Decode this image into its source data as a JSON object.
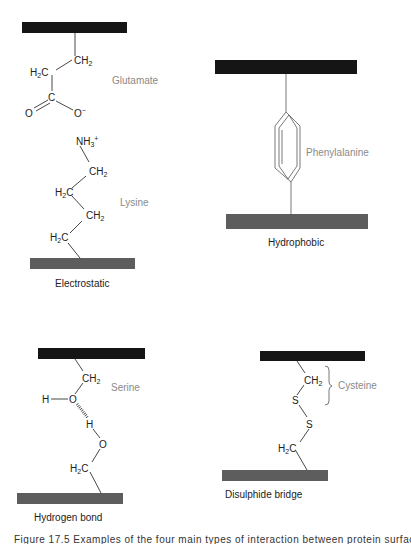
{
  "colors": {
    "surface_top": "#151515",
    "surface_bottom": "#5d5d5d",
    "residue_label": "#8a8a8a",
    "text": "#222222"
  },
  "panels": {
    "electrostatic": {
      "caption": "Electrostatic",
      "top_residue": {
        "name": "Glutamate",
        "atoms": {
          "ch2": "CH",
          "h2c_h": "H",
          "h2c_c": "C",
          "c": "C",
          "o_double": "O",
          "o_minus": "O"
        },
        "sub2": "2",
        "charge_minus": "−"
      },
      "bottom_residue": {
        "name": "Lysine",
        "atoms": {
          "nh3": "NH",
          "ch2_a": "CH",
          "h2c_a_h": "H",
          "h2c_a_c": "C",
          "ch2_b": "CH",
          "h2c_b_h": "H",
          "h2c_b_c": "C"
        },
        "sub2": "2",
        "sub3": "3",
        "charge_plus": "+"
      }
    },
    "hydrophobic": {
      "caption": "Hydrophobic",
      "residue": {
        "name": "Phenylalanine"
      }
    },
    "hydrogen_bond": {
      "caption": "Hydrogen bond",
      "residue": {
        "name": "Serine",
        "atoms": {
          "ch2": "CH",
          "h_left": "H",
          "o_top": "O",
          "h_mid": "H",
          "o_bottom": "O",
          "h2c_h": "H",
          "h2c_c": "C"
        },
        "sub2": "2"
      }
    },
    "disulphide_bridge": {
      "caption": "Disulphide bridge",
      "residue": {
        "name": "Cysteine",
        "atoms": {
          "ch2": "CH",
          "s_top": "S",
          "s_bottom": "S",
          "h2c_h": "H",
          "h2c_c": "C"
        },
        "sub2": "2"
      }
    }
  },
  "figure_caption": "Figure 17.5   Examples of the four main types of interaction between protein surfaces"
}
